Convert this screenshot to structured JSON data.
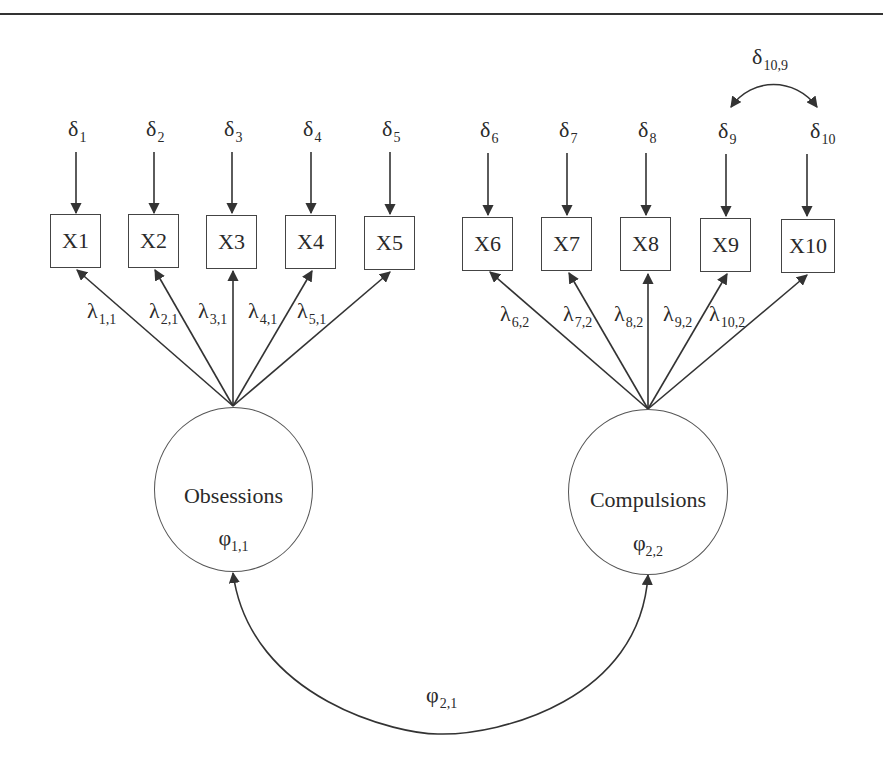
{
  "diagram": {
    "type": "confirmatory-factor-analysis-path-diagram",
    "latent_factors": [
      {
        "id": "f1",
        "name": "Obsessions",
        "variance": {
          "sym": "φ",
          "sub": "1,1"
        }
      },
      {
        "id": "f2",
        "name": "Compulsions",
        "variance": {
          "sym": "φ",
          "sub": "2,2"
        }
      }
    ],
    "factor_covariance": {
      "sym": "φ",
      "sub": "2,1"
    },
    "indicators": [
      {
        "label": "X1",
        "error": {
          "sym": "δ",
          "sub": "1"
        },
        "loading": {
          "sym": "λ",
          "sub": "1,1"
        },
        "factor": "f1"
      },
      {
        "label": "X2",
        "error": {
          "sym": "δ",
          "sub": "2"
        },
        "loading": {
          "sym": "λ",
          "sub": "2,1"
        },
        "factor": "f1"
      },
      {
        "label": "X3",
        "error": {
          "sym": "δ",
          "sub": "3"
        },
        "loading": {
          "sym": "λ",
          "sub": "3,1"
        },
        "factor": "f1"
      },
      {
        "label": "X4",
        "error": {
          "sym": "δ",
          "sub": "4"
        },
        "loading": {
          "sym": "λ",
          "sub": "4,1"
        },
        "factor": "f1"
      },
      {
        "label": "X5",
        "error": {
          "sym": "δ",
          "sub": "5"
        },
        "loading": {
          "sym": "λ",
          "sub": "5,1"
        },
        "factor": "f1"
      },
      {
        "label": "X6",
        "error": {
          "sym": "δ",
          "sub": "6"
        },
        "loading": {
          "sym": "λ",
          "sub": "6,2"
        },
        "factor": "f2"
      },
      {
        "label": "X7",
        "error": {
          "sym": "δ",
          "sub": "7"
        },
        "loading": {
          "sym": "λ",
          "sub": "7,2"
        },
        "factor": "f2"
      },
      {
        "label": "X8",
        "error": {
          "sym": "δ",
          "sub": "8"
        },
        "loading": {
          "sym": "λ",
          "sub": "8,2"
        },
        "factor": "f2"
      },
      {
        "label": "X9",
        "error": {
          "sym": "δ",
          "sub": "9"
        },
        "loading": {
          "sym": "λ",
          "sub": "9,2"
        },
        "factor": "f2"
      },
      {
        "label": "X10",
        "error": {
          "sym": "δ",
          "sub": "10"
        },
        "loading": {
          "sym": "λ",
          "sub": "10,2"
        },
        "factor": "f2"
      }
    ],
    "error_covariance": {
      "sym": "δ",
      "sub": "10,9",
      "between": [
        "X9",
        "X10"
      ]
    },
    "colors": {
      "line": "#333333",
      "text": "#2a2a2a",
      "background": "#ffffff"
    }
  }
}
